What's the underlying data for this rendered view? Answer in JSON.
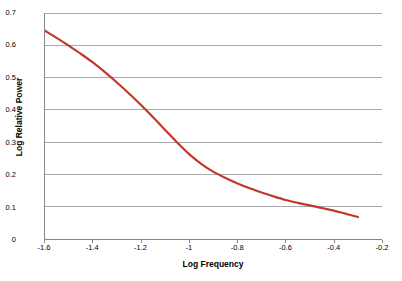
{
  "chart_data": {
    "type": "line",
    "title": "",
    "xlabel": "Log Frequency",
    "ylabel": "Log Relative Power",
    "xlim": [
      -1.6,
      -0.2
    ],
    "ylim": [
      0,
      0.7
    ],
    "grid": "horizontal",
    "legend": "none",
    "line_color": "#C0392B",
    "xticks": [
      "-1.6",
      "-1.4",
      "-1.2",
      "-1",
      "-0.8",
      "-0.6",
      "-0.4",
      "-0.2"
    ],
    "xtick_values": [
      -1.6,
      -1.4,
      -1.2,
      -1,
      -0.8,
      -0.6,
      -0.4,
      -0.2
    ],
    "yticks": [
      "0",
      "0.1",
      "0.2",
      "0.3",
      "0.4",
      "0.5",
      "0.6",
      "0.7"
    ],
    "ytick_values": [
      0,
      0.1,
      0.2,
      0.3,
      0.4,
      0.5,
      0.6,
      0.7
    ],
    "series": [
      {
        "name": "Log Relative Power",
        "x": [
          -1.6,
          -1.55,
          -1.5,
          -1.45,
          -1.4,
          -1.35,
          -1.3,
          -1.25,
          -1.2,
          -1.15,
          -1.1,
          -1.05,
          -1.0,
          -0.95,
          -0.9,
          -0.85,
          -0.8,
          -0.75,
          -0.7,
          -0.65,
          -0.6,
          -0.55,
          -0.5,
          -0.45,
          -0.4,
          -0.35,
          -0.3
        ],
        "y": [
          0.645,
          0.622,
          0.598,
          0.573,
          0.546,
          0.516,
          0.484,
          0.45,
          0.414,
          0.376,
          0.337,
          0.298,
          0.262,
          0.232,
          0.208,
          0.189,
          0.172,
          0.157,
          0.144,
          0.132,
          0.121,
          0.112,
          0.104,
          0.096,
          0.088,
          0.078,
          0.068
        ]
      }
    ]
  }
}
